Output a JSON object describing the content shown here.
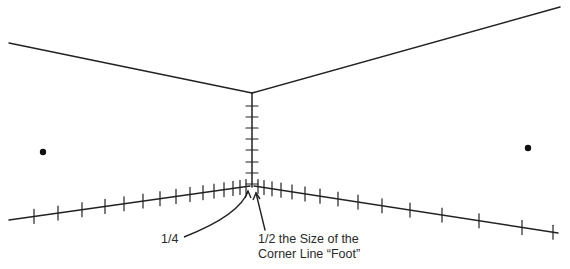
{
  "diagram": {
    "stroke_color": "#222222",
    "labels": {
      "quarter": "1/4",
      "half_line1": "1/2 the Size of the",
      "half_line2": "Corner Line “Foot”"
    },
    "ceiling_lines": {
      "left": [
        [
          9,
          43
        ],
        [
          252,
          93
        ]
      ],
      "right": [
        [
          252,
          93
        ],
        [
          560,
          7
        ]
      ]
    },
    "corner_line": {
      "top": [
        252,
        93
      ],
      "bottom": [
        252,
        187
      ],
      "ticks_y": [
        106,
        117,
        128,
        139,
        150,
        162,
        173,
        184
      ]
    },
    "floor_lines": {
      "left": [
        [
          9,
          220
        ],
        [
          250,
          186
        ]
      ],
      "right": [
        [
          254,
          186
        ],
        [
          558,
          233
        ]
      ],
      "left_ticks_x": [
        34,
        58,
        82,
        105,
        124,
        143,
        160,
        176,
        190,
        203,
        214,
        224,
        233,
        240,
        246
      ],
      "right_ticks_x": [
        258,
        264,
        272,
        281,
        292,
        305,
        320,
        338,
        358,
        382,
        410,
        442,
        479,
        522,
        553
      ]
    },
    "dots": [
      [
        43,
        152
      ],
      [
        528,
        148
      ]
    ],
    "arrows": {
      "quarter": {
        "from": [
          184,
          237
        ],
        "ctrl": [
          240,
          215
        ],
        "to": [
          248,
          191
        ]
      },
      "half": {
        "from": [
          265,
          230
        ],
        "to": [
          256,
          193
        ]
      }
    }
  }
}
